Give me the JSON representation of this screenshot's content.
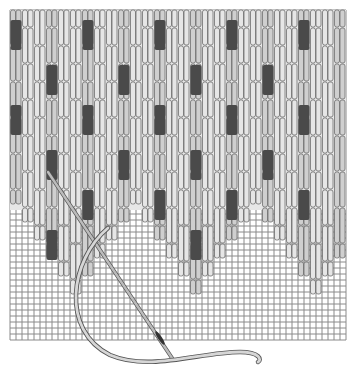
{
  "illustration": {
    "subject": "needlepoint stitch illustration",
    "canvas": {
      "x": 10,
      "y": 10,
      "width": 336,
      "height": 330,
      "mesh_pitch": 6
    },
    "colors": {
      "background": "#ffffff",
      "mesh": "#8a8a8a",
      "stitch_light": "#e6e6e6",
      "stitch_mid": "#cfcfcf",
      "stitch_outline": "#6e6e6e",
      "stitch_dark": "#4a4a4a",
      "needle": "#bcbcbc",
      "thread": "#d6d6d6"
    },
    "stitch_columns": 28,
    "stitch_length": 36,
    "accent_rows": [
      60,
      150,
      240
    ]
  }
}
